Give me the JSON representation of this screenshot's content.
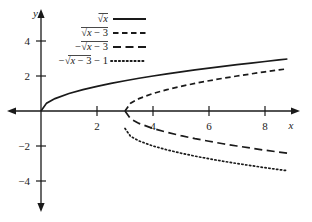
{
  "chart_data": {
    "type": "line",
    "title": "",
    "xlabel": "x",
    "ylabel": "y",
    "xlim": [
      -1.4,
      9.6
    ],
    "ylim": [
      -5.8,
      5.2
    ],
    "xticks": [
      2,
      4,
      6,
      8
    ],
    "yticks": [
      4,
      2,
      -2,
      -4
    ],
    "xtick_labels": [
      "2",
      "4",
      "6",
      "8"
    ],
    "ytick_labels": [
      "4",
      "2",
      "−2",
      "−4"
    ],
    "grid": false,
    "legend_position": "top-center",
    "axes_style": "arrowed-cartesian",
    "series": [
      {
        "name": "sqrt_x",
        "label": "√x",
        "label_parts": {
          "sign": "",
          "radicand": "x",
          "offset": ""
        },
        "style": "solid",
        "color": "#1a1a1a",
        "domain": [
          0,
          8.8
        ],
        "x": [
          0,
          0.2,
          0.5,
          1,
          1.5,
          2,
          2.5,
          3,
          3.5,
          4,
          4.5,
          5,
          5.5,
          6,
          6.5,
          7,
          7.5,
          8,
          8.5,
          8.8
        ],
        "y": [
          0,
          0.45,
          0.71,
          1,
          1.22,
          1.41,
          1.58,
          1.73,
          1.87,
          2,
          2.12,
          2.24,
          2.35,
          2.45,
          2.55,
          2.65,
          2.74,
          2.83,
          2.92,
          2.97
        ]
      },
      {
        "name": "sqrt_x_minus_3",
        "label": "√(x − 3)",
        "label_parts": {
          "sign": "",
          "radicand": "x − 3",
          "offset": ""
        },
        "style": "dashed-short",
        "color": "#1a1a1a",
        "domain": [
          3,
          8.8
        ],
        "x": [
          3,
          3.2,
          3.5,
          4,
          4.5,
          5,
          5.5,
          6,
          6.5,
          7,
          7.5,
          8,
          8.5,
          8.8
        ],
        "y": [
          0,
          0.45,
          0.71,
          1,
          1.22,
          1.41,
          1.58,
          1.73,
          1.87,
          2,
          2.12,
          2.24,
          2.35,
          2.41
        ]
      },
      {
        "name": "neg_sqrt_x_minus_3",
        "label": "−√(x − 3)",
        "label_parts": {
          "sign": "−",
          "radicand": "x − 3",
          "offset": ""
        },
        "style": "dashed-long",
        "color": "#1a1a1a",
        "domain": [
          3,
          8.8
        ],
        "x": [
          3,
          3.2,
          3.5,
          4,
          4.5,
          5,
          5.5,
          6,
          6.5,
          7,
          7.5,
          8,
          8.5,
          8.8
        ],
        "y": [
          0,
          -0.45,
          -0.71,
          -1,
          -1.22,
          -1.41,
          -1.58,
          -1.73,
          -1.87,
          -2,
          -2.12,
          -2.24,
          -2.35,
          -2.41
        ]
      },
      {
        "name": "neg_sqrt_x_minus_3_minus_1",
        "label": "−√(x − 3) − 1",
        "label_parts": {
          "sign": "−",
          "radicand": "x − 3",
          "offset": "− 1"
        },
        "style": "dotted",
        "color": "#1a1a1a",
        "domain": [
          3,
          8.8
        ],
        "x": [
          3,
          3.2,
          3.5,
          4,
          4.5,
          5,
          5.5,
          6,
          6.5,
          7,
          7.5,
          8,
          8.5,
          8.8
        ],
        "y": [
          -1,
          -1.45,
          -1.71,
          -2,
          -2.22,
          -2.41,
          -2.58,
          -2.73,
          -2.87,
          -3,
          -3.12,
          -3.24,
          -3.35,
          -3.41
        ]
      }
    ]
  },
  "colors": {
    "ink": "#1a1a1a",
    "background": "#ffffff"
  }
}
